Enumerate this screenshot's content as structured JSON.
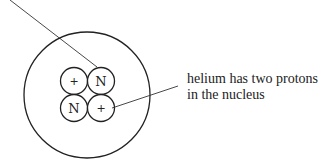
{
  "diagram": {
    "caption": {
      "lines": [
        "helium has two protons",
        "in the nucleus"
      ]
    },
    "particles": [
      {
        "position": "top-left",
        "label": "+",
        "type": "proton"
      },
      {
        "position": "top-right",
        "label": "N",
        "type": "neutron"
      },
      {
        "position": "bottom-left",
        "label": "N",
        "type": "neutron"
      },
      {
        "position": "bottom-right",
        "label": "+",
        "type": "proton"
      }
    ],
    "colors": {
      "stroke": "#222222",
      "background": "#ffffff"
    }
  }
}
